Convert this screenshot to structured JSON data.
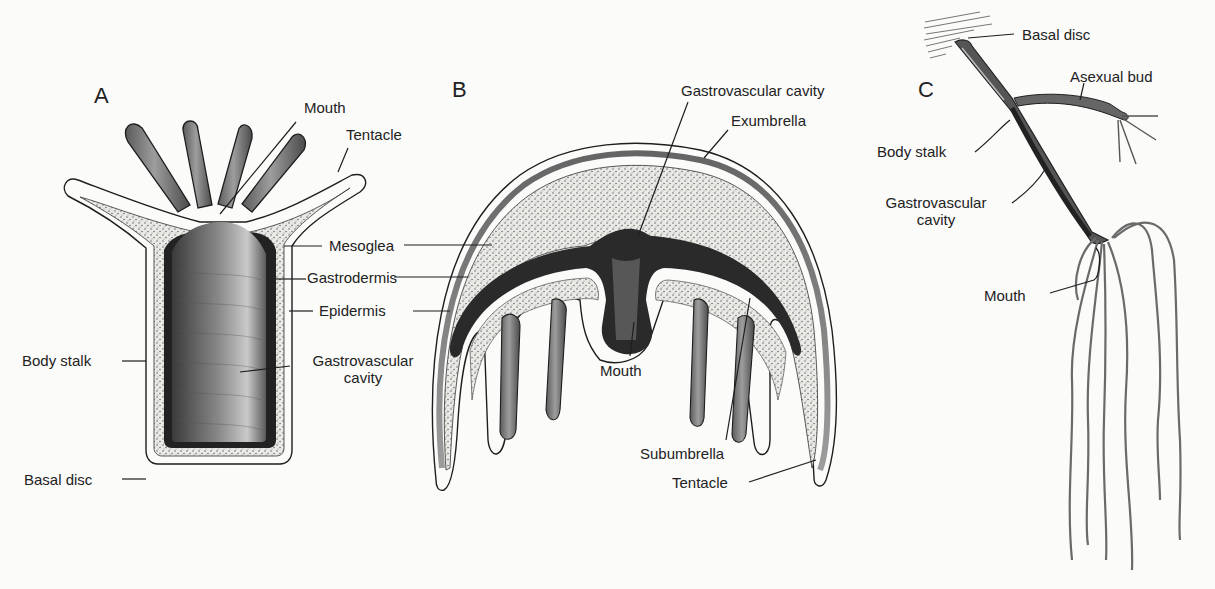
{
  "figure": {
    "panels": [
      {
        "id": "A",
        "letter": "A",
        "labels": {
          "mouth": "Mouth",
          "tentacle": "Tentacle",
          "mesoglea": "Mesoglea",
          "gastrodermis": "Gastrodermis",
          "epidermis": "Epidermis",
          "body_stalk": "Body stalk",
          "gastrovascular_1": "Gastrovascular",
          "gastrovascular_2": "cavity",
          "basal_disc": "Basal disc"
        }
      },
      {
        "id": "B",
        "letter": "B",
        "labels": {
          "gastrovascular_cavity": "Gastrovascular cavity",
          "exumbrella": "Exumbrella",
          "mouth": "Mouth",
          "subumbrella": "Subumbrella",
          "tentacle": "Tentacle"
        }
      },
      {
        "id": "C",
        "letter": "C",
        "labels": {
          "basal_disc": "Basal disc",
          "asexual_bud": "Asexual bud",
          "body_stalk": "Body stalk",
          "gastrovascular_1": "Gastrovascular",
          "gastrovascular_2": "cavity",
          "mouth": "Mouth"
        }
      }
    ],
    "colors": {
      "ink": "#1e1e1e",
      "dark_tissue": "#2b2b2b",
      "mid_tissue": "#6a6a6a",
      "stipple_bg": "#e6e6e2",
      "paper": "#fbfbfa"
    }
  }
}
